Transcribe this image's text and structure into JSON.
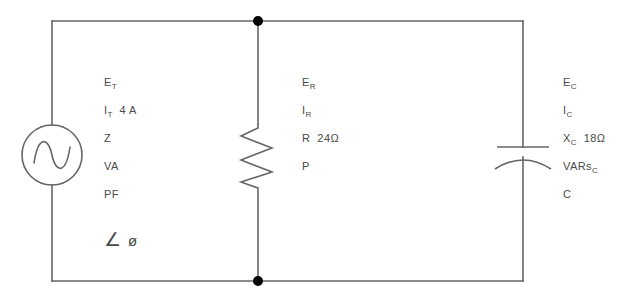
{
  "diagram": {
    "line_color": "#666666",
    "text_color": "#4a4a4a",
    "node_color": "#000000"
  },
  "source_branch": {
    "component": "ac-voltage-source",
    "rows": [
      {
        "symbol": "E",
        "sub": "T",
        "value": ""
      },
      {
        "symbol": "I",
        "sub": "T",
        "value": "4 A"
      },
      {
        "symbol": "Z",
        "sub": "",
        "value": ""
      },
      {
        "symbol": "VA",
        "sub": "",
        "value": ""
      },
      {
        "symbol": "PF",
        "sub": "",
        "value": ""
      }
    ],
    "angle_symbol": "∠",
    "phase_symbol": "ø"
  },
  "resistor_branch": {
    "component": "resistor",
    "rows": [
      {
        "symbol": "E",
        "sub": "R",
        "value": ""
      },
      {
        "symbol": "I",
        "sub": "R",
        "value": ""
      },
      {
        "symbol": "R",
        "sub": "",
        "value": "24Ω"
      },
      {
        "symbol": "P",
        "sub": "",
        "value": ""
      }
    ]
  },
  "capacitor_branch": {
    "component": "capacitor",
    "rows": [
      {
        "symbol": "E",
        "sub": "C",
        "value": ""
      },
      {
        "symbol": "I",
        "sub": "C",
        "value": ""
      },
      {
        "symbol": "X",
        "sub": "C",
        "value": "18Ω"
      },
      {
        "symbol": "VARs",
        "sub": "C",
        "value": ""
      },
      {
        "symbol": "C",
        "sub": "",
        "value": ""
      }
    ]
  }
}
